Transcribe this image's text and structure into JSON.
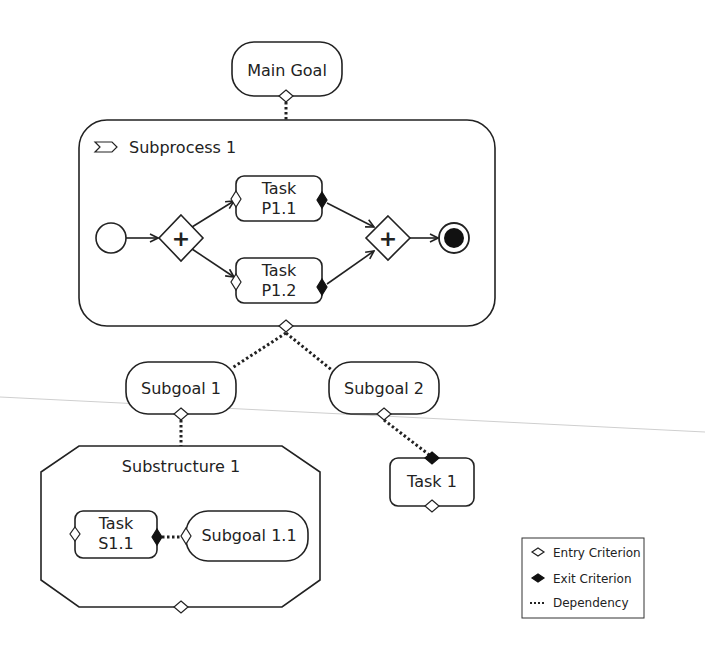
{
  "diagram": {
    "main_goal": {
      "label": "Main Goal"
    },
    "subprocess": {
      "label": "Subprocess 1",
      "tasks": [
        {
          "line1": "Task",
          "line2": "P1.1"
        },
        {
          "line1": "Task",
          "line2": "P1.2"
        }
      ],
      "gateway_symbol": "+"
    },
    "subgoals": [
      {
        "label": "Subgoal 1"
      },
      {
        "label": "Subgoal 2"
      }
    ],
    "substructure": {
      "label": "Substructure 1",
      "task": {
        "line1": "Task",
        "line2": "S1.1"
      },
      "subgoal": {
        "label": "Subgoal 1.1"
      }
    },
    "task1": {
      "label": "Task 1"
    }
  },
  "legend": {
    "items": [
      {
        "icon": "entry-criterion-icon",
        "label": "Entry Criterion"
      },
      {
        "icon": "exit-criterion-icon",
        "label": "Exit Criterion"
      },
      {
        "icon": "dependency-icon",
        "label": "Dependency"
      }
    ]
  }
}
